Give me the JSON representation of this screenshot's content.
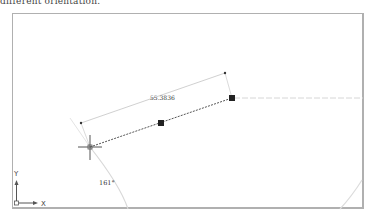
{
  "caption": "different orientation.",
  "drawing": {
    "dimension_value": "55.3836",
    "angle_value": "161°",
    "ucs": {
      "x_label": "X",
      "y_label": "Y"
    }
  },
  "colors": {
    "frame": "#b0b0b0",
    "line": "#555555",
    "grip": "#222222",
    "tracking": "#d6d6d6"
  }
}
